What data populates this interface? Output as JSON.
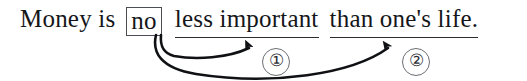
{
  "figure": {
    "type": "annotated-sentence-diagram",
    "background_color": "#ffffff",
    "ink_color": "#15161a",
    "rule_color": "#2a2c30",
    "box_border_color": "#4a4d52",
    "circle_border_color": "#6b6e73"
  },
  "sentence": {
    "full_text": "Money is no less important than one's life.",
    "segments": [
      {
        "id": "s1",
        "text": "Money is",
        "style": "plain"
      },
      {
        "id": "s2",
        "text": "no",
        "style": "boxed"
      },
      {
        "id": "s3",
        "text": "less important",
        "style": "underlined"
      },
      {
        "id": "s4",
        "text": "than one's life.",
        "style": "underlined"
      }
    ]
  },
  "markers": [
    {
      "id": "m1",
      "label": "①",
      "number": "1",
      "refers_to": "s3"
    },
    {
      "id": "m2",
      "label": "②",
      "number": "2",
      "refers_to": "s4"
    }
  ],
  "arrows": [
    {
      "id": "arrow-1",
      "from": "no",
      "to": "less important",
      "marker": "①",
      "head": "solid-triangle-up"
    },
    {
      "id": "arrow-2",
      "from": "no",
      "to": "than one's life",
      "marker": "②",
      "head": "solid-triangle-up"
    }
  ]
}
